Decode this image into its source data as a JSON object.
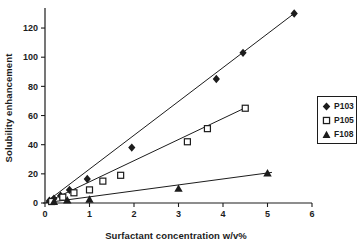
{
  "colors": {
    "ink": "#1c1c1c",
    "background": "#ffffff"
  },
  "chart_data": {
    "type": "scatter",
    "title": "",
    "xlabel": "Surfactant concentration w/v%",
    "ylabel": "Solubility enhancement",
    "xlim": [
      0,
      6
    ],
    "ylim": [
      0,
      130
    ],
    "xticks": [
      0,
      1,
      2,
      3,
      4,
      5,
      6
    ],
    "yticks": [
      0,
      20,
      40,
      60,
      80,
      100,
      120
    ],
    "grid": false,
    "legend_position": "right",
    "series": [
      {
        "name": "P103",
        "marker": "diamond",
        "filled": true,
        "points": [
          [
            0.1,
            1.5
          ],
          [
            0.2,
            3
          ],
          [
            0.35,
            5
          ],
          [
            0.55,
            9
          ],
          [
            0.95,
            16.5
          ],
          [
            1.95,
            38
          ],
          [
            3.85,
            85
          ],
          [
            4.45,
            103
          ],
          [
            5.6,
            130
          ]
        ],
        "trendline": [
          [
            0.02,
            0.5
          ],
          [
            5.6,
            130
          ]
        ]
      },
      {
        "name": "P105",
        "marker": "square",
        "filled": false,
        "points": [
          [
            0.15,
            1
          ],
          [
            0.4,
            4
          ],
          [
            0.65,
            7
          ],
          [
            1.0,
            9
          ],
          [
            1.3,
            15
          ],
          [
            1.7,
            19
          ],
          [
            3.2,
            42
          ],
          [
            3.65,
            51
          ],
          [
            4.5,
            65
          ]
        ],
        "trendline": [
          [
            0.02,
            0.3
          ],
          [
            4.55,
            66
          ]
        ]
      },
      {
        "name": "F108",
        "marker": "triangle",
        "filled": true,
        "points": [
          [
            0.2,
            1
          ],
          [
            0.5,
            2
          ],
          [
            1.0,
            2.5
          ],
          [
            3.0,
            10
          ],
          [
            5.0,
            20.5
          ]
        ],
        "trendline": [
          [
            0.02,
            0.2
          ],
          [
            5.1,
            21
          ]
        ]
      }
    ]
  }
}
